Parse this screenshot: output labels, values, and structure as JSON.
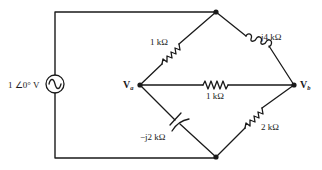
{
  "diagram": {
    "type": "circuit",
    "source": {
      "label": "1 ∠0° V",
      "kind": "ac-voltage-source"
    },
    "nodes": {
      "va": {
        "label": "V",
        "subscript": "a"
      },
      "vb": {
        "label": "V",
        "subscript": "b"
      },
      "top": {
        "label": ""
      },
      "bottom": {
        "label": ""
      }
    },
    "components": [
      {
        "id": "r_top_left",
        "kind": "resistor",
        "label": "1 kΩ",
        "from": "va",
        "to": "top"
      },
      {
        "id": "l_top_right",
        "kind": "inductor",
        "label": "j4 kΩ",
        "from": "top",
        "to": "vb"
      },
      {
        "id": "r_middle",
        "kind": "resistor",
        "label": "1 kΩ",
        "from": "va",
        "to": "vb"
      },
      {
        "id": "c_bottom_left",
        "kind": "capacitor",
        "label": "−j2 kΩ",
        "from": "va",
        "to": "bottom"
      },
      {
        "id": "r_bottom_right",
        "kind": "resistor",
        "label": "2 kΩ",
        "from": "bottom",
        "to": "vb"
      }
    ],
    "colors": {
      "ink": "#1a1a1a",
      "background": "#ffffff"
    }
  }
}
